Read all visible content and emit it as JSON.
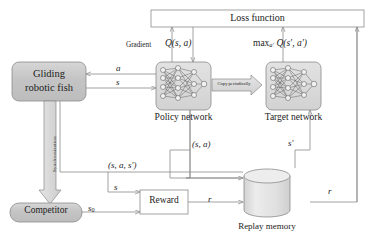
{
  "figure": {
    "type": "block-diagram"
  },
  "blocks": {
    "loss_function": {
      "label": "Loss function",
      "shape": "rectangle",
      "fill": "#ffffff"
    },
    "gliding_robotic_fish": {
      "label_line1": "Gliding",
      "label_line2": "robotic fish",
      "shape": "rounded-rectangle",
      "fill": "#c9c9c9"
    },
    "policy_network": {
      "label": "Policy network",
      "shape": "rounded-rectangle",
      "fill": "#dcdcdc"
    },
    "target_network": {
      "label": "Target network",
      "shape": "rounded-rectangle",
      "fill": "#dcdcdc"
    },
    "competitor": {
      "label": "Competitor",
      "shape": "rounded-rectangle",
      "fill": "#c9c9c9"
    },
    "reward": {
      "label": "Reward",
      "shape": "rectangle",
      "fill": "#ffffff"
    },
    "replay_memory": {
      "label": "Replay memory",
      "shape": "cylinder",
      "fill": "#e3e3e3"
    }
  },
  "arrows": {
    "copy_periodically": {
      "label": "Copy periodically",
      "shape": "block-arrow",
      "direction": "right"
    },
    "synchronization": {
      "label": "Synchronization",
      "shape": "block-arrow",
      "direction": "down"
    }
  },
  "edge_labels": {
    "gradient": "Gradient",
    "q_s_a": "Q(s, a)",
    "max_q": "max",
    "max_q_sub": "a′",
    "max_q_rest": "Q(s′, a′)",
    "action_a": "a",
    "state_s": "s",
    "tuple_s_a": "(s, a)",
    "next_state": "s′",
    "tuple_s_a_sprime": "(s, a, s′)",
    "state_to_reward": "s",
    "initial_state": "s",
    "initial_state_sub": "0",
    "reward_left": "r",
    "reward_right": "r"
  },
  "colors": {
    "stroke": "#8c8c8c",
    "dark_block": "#c9c9c9",
    "light_block": "#dcdcdc",
    "cylinder": "#e3e3e3",
    "text": "#1c1c1c"
  }
}
